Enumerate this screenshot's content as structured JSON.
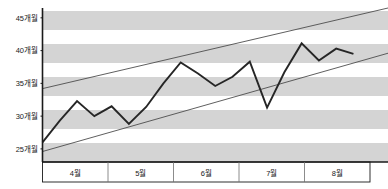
{
  "chart_data": {
    "type": "line",
    "title": "",
    "subtitle": "",
    "xlabel": "",
    "ylabel": "",
    "grid": "horizontal-banded",
    "legend": "none",
    "ylim": [
      23,
      46.5
    ],
    "yticks": [
      25,
      30,
      35,
      40,
      45
    ],
    "ytick_labels": [
      "25개월",
      "30개월",
      "35개월",
      "40개월",
      "45개월"
    ],
    "categories": [
      "4월",
      "5월",
      "6월",
      "7월",
      "8월"
    ],
    "xlim": [
      0,
      20
    ],
    "series": [
      {
        "name": "data",
        "color": "#262626",
        "x": [
          0,
          1,
          2,
          3,
          4,
          5,
          6,
          7,
          8,
          9,
          10,
          11,
          12,
          13,
          14,
          15,
          16,
          17,
          18
        ],
        "values": [
          26.0,
          29.3,
          32.3,
          30.0,
          31.5,
          28.8,
          31.4,
          35.0,
          38.2,
          36.5,
          34.6,
          36.0,
          38.3,
          31.3,
          36.7,
          41.1,
          38.5,
          40.3,
          39.5
        ]
      },
      {
        "name": "upper-trend-line",
        "color": "#4d4d4d",
        "x": [
          0,
          20
        ],
        "values": [
          34.2,
          46.5
        ]
      },
      {
        "name": "lower-trend-line",
        "color": "#4d4d4d",
        "x": [
          0,
          20
        ],
        "values": [
          24.6,
          39.6
        ]
      }
    ],
    "final_value": 46.3,
    "band_color": "#d4d4d4",
    "band_alt_color": "#ffffff",
    "axis_color": "#1a1a1a"
  },
  "axes": {
    "y": {
      "ticks": [
        {
          "label": "45개월",
          "value": 45
        },
        {
          "label": "40개월",
          "value": 40
        },
        {
          "label": "35개월",
          "value": 35
        },
        {
          "label": "30개월",
          "value": 30
        },
        {
          "label": "25개월",
          "value": 25
        }
      ]
    },
    "x": {
      "ticks": [
        {
          "label": "4월"
        },
        {
          "label": "5월"
        },
        {
          "label": "6월"
        },
        {
          "label": "7월"
        },
        {
          "label": "8월"
        }
      ]
    }
  }
}
